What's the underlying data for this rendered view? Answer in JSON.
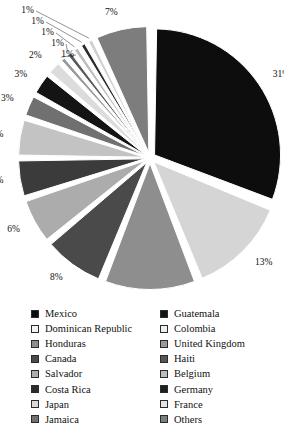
{
  "chart_data": {
    "type": "pie",
    "title": "",
    "subtitle": "",
    "xlabel": "",
    "ylabel": "",
    "legend_position": "bottom",
    "exploded": true,
    "label_suffix": "%",
    "categories": [
      "Mexico",
      "Guatemala",
      "Dominican Republic",
      "Colombia",
      "Honduras",
      "United Kingdom",
      "Canada",
      "Haiti",
      "Salvador",
      "Belgium",
      "Costa Rica",
      "Germany",
      "Japan",
      "France",
      "Jamaica",
      "Others"
    ],
    "values": [
      31,
      13,
      12,
      8,
      6,
      5,
      5,
      3,
      3,
      2,
      1,
      1,
      1,
      1,
      1,
      7
    ],
    "slices": [
      {
        "label": "Mexico",
        "value": 31,
        "display": "31%",
        "color": "#0d0d0d"
      },
      {
        "label": "Dominican Republic",
        "value": 13,
        "display": "13%",
        "color": "#d5d5d5"
      },
      {
        "label": "Honduras",
        "value": 12,
        "display": "12%",
        "color": "#8e8e8e"
      },
      {
        "label": "Canada",
        "value": 8,
        "display": "8%",
        "color": "#4a4a4a"
      },
      {
        "label": "Salvador",
        "value": 6,
        "display": "6%",
        "color": "#acacac"
      },
      {
        "label": "Costa Rica",
        "value": 5,
        "display": "5%",
        "color": "#3b3b3b"
      },
      {
        "label": "Japan",
        "value": 5,
        "display": "5%",
        "color": "#c3c3c3"
      },
      {
        "label": "Jamaica",
        "value": 3,
        "display": "3%",
        "color": "#707070"
      },
      {
        "label": "Guatemala",
        "value": 3,
        "display": "3%",
        "color": "#141414"
      },
      {
        "label": "Colombia",
        "value": 2,
        "display": "2%",
        "color": "#dcdcdc"
      },
      {
        "label": "United Kingdom",
        "value": 1,
        "display": "1%",
        "color": "#9a9a9a"
      },
      {
        "label": "Haiti",
        "value": 1,
        "display": "1%",
        "color": "#5a5a5a"
      },
      {
        "label": "Belgium",
        "value": 1,
        "display": "1%",
        "color": "#bcbcbc"
      },
      {
        "label": "Germany",
        "value": 1,
        "display": "1%",
        "color": "#2b2b2b"
      },
      {
        "label": "France",
        "value": 1,
        "display": "1%",
        "color": "#cfcfcf"
      },
      {
        "label": "Others",
        "value": 7,
        "display": "7%",
        "color": "#7d7d7d"
      }
    ]
  },
  "legend": {
    "left_column": [
      {
        "label": "Mexico",
        "color": "#0d0d0d"
      },
      {
        "label": "Dominican Republic",
        "color": "#f2f2f2"
      },
      {
        "label": "Honduras",
        "color": "#8e8e8e"
      },
      {
        "label": "Canada",
        "color": "#4a4a4a"
      },
      {
        "label": "Salvador",
        "color": "#acacac"
      },
      {
        "label": "Costa Rica",
        "color": "#2b2b2b"
      },
      {
        "label": "Japan",
        "color": "#d9d9d9"
      },
      {
        "label": "Jamaica",
        "color": "#707070"
      }
    ],
    "right_column": [
      {
        "label": "Guatemala",
        "color": "#141414"
      },
      {
        "label": "Colombia",
        "color": "#efefef"
      },
      {
        "label": "United Kingdom",
        "color": "#9a9a9a"
      },
      {
        "label": "Haiti",
        "color": "#565656"
      },
      {
        "label": "Belgium",
        "color": "#bcbcbc"
      },
      {
        "label": "Germany",
        "color": "#1f1f1f"
      },
      {
        "label": "France",
        "color": "#e3e3e3"
      },
      {
        "label": "Others",
        "color": "#7d7d7d"
      }
    ]
  }
}
